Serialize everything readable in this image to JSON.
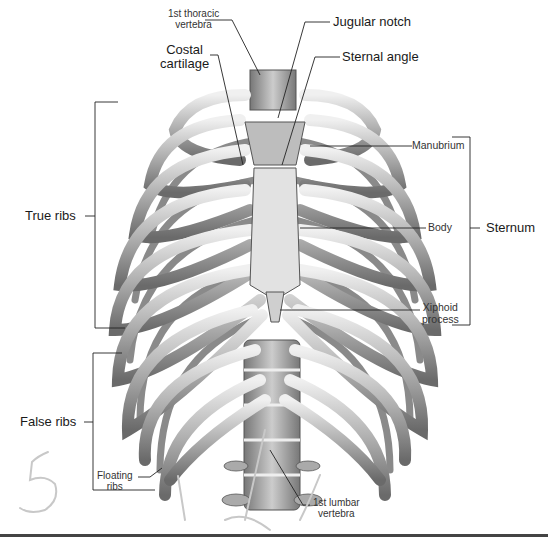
{
  "diagram": {
    "labels": {
      "first_thoracic_vertebra": "1st thoracic\nvertebra",
      "first_thoracic_vertebra_l1": "1st thoracic",
      "first_thoracic_vertebra_l2": "vertebra",
      "jugular_notch": "Jugular notch",
      "costal_cartilage_l1": "Costal",
      "costal_cartilage_l2": "cartilage",
      "sternal_angle": "Sternal angle",
      "manubrium": "Manubrium",
      "true_ribs": "True ribs",
      "body": "Body",
      "sternum": "Sternum",
      "xiphoid_l1": "Xiphoid",
      "xiphoid_l2": "process",
      "false_ribs": "False ribs",
      "floating_l1": "Floating",
      "floating_l2": "ribs",
      "lumbar_l1": "1st lumbar",
      "lumbar_l2": "vertebra"
    },
    "handwriting": {
      "number": "5"
    },
    "colors": {
      "bone_light": "#e8e8e8",
      "bone_mid": "#a8a8a8",
      "bone_dark": "#5a5a5a",
      "line": "#222222",
      "handwriting": "#c8c8c8"
    }
  }
}
